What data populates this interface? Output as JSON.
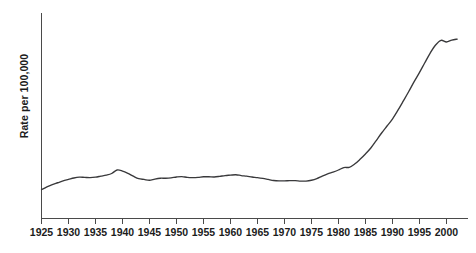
{
  "chart_data": {
    "type": "line",
    "title": "",
    "xlabel": "",
    "ylabel": "Rate per 100,000",
    "xlim": [
      1925,
      2004
    ],
    "ylim": [
      0,
      100
    ],
    "grid": false,
    "legend": null,
    "xticks": [
      1925,
      1930,
      1935,
      1940,
      1945,
      1950,
      1955,
      1960,
      1965,
      1970,
      1975,
      1980,
      1985,
      1990,
      1995,
      2000
    ],
    "xtick_labels": [
      "1925",
      "1930",
      "1935",
      "1940",
      "1945",
      "1950",
      "1955",
      "1960",
      "1965",
      "1970",
      "1975",
      "1980",
      "1985",
      "1990",
      "1995",
      "2000"
    ],
    "yticks": [],
    "ytick_labels": [],
    "series": [
      {
        "name": "Rate per 100,000",
        "color": "#39393b",
        "x": [
          1925,
          1926,
          1927,
          1928,
          1929,
          1930,
          1931,
          1932,
          1933,
          1934,
          1935,
          1936,
          1937,
          1938,
          1939,
          1940,
          1941,
          1942,
          1943,
          1944,
          1945,
          1946,
          1947,
          1948,
          1949,
          1950,
          1951,
          1952,
          1953,
          1954,
          1955,
          1956,
          1957,
          1958,
          1959,
          1960,
          1961,
          1962,
          1963,
          1964,
          1965,
          1966,
          1967,
          1968,
          1969,
          1970,
          1971,
          1972,
          1973,
          1974,
          1975,
          1976,
          1977,
          1978,
          1979,
          1980,
          1981,
          1982,
          1983,
          1984,
          1985,
          1986,
          1987,
          1988,
          1989,
          1990,
          1991,
          1992,
          1993,
          1994,
          1995,
          1996,
          1997,
          1998,
          1999,
          2000,
          2001,
          2002
        ],
        "y": [
          14.0,
          15.4,
          16.5,
          17.4,
          18.3,
          19.0,
          19.7,
          20.1,
          20.0,
          19.9,
          20.1,
          20.6,
          21.1,
          21.9,
          23.6,
          23.1,
          22.0,
          20.6,
          19.4,
          19.0,
          18.6,
          19.2,
          19.6,
          19.6,
          19.8,
          20.2,
          20.4,
          20.0,
          19.9,
          20.0,
          20.3,
          20.3,
          20.2,
          20.5,
          20.9,
          21.1,
          21.3,
          20.9,
          20.6,
          20.2,
          19.9,
          19.5,
          19.0,
          18.5,
          18.3,
          18.3,
          18.4,
          18.4,
          18.2,
          18.2,
          18.6,
          19.4,
          20.6,
          21.7,
          22.6,
          23.6,
          24.8,
          24.9,
          26.5,
          28.8,
          31.4,
          34.3,
          37.9,
          41.6,
          45.0,
          48.4,
          52.6,
          57.1,
          61.7,
          66.5,
          71.0,
          75.8,
          80.5,
          84.4,
          86.7,
          85.9,
          86.8,
          87.3
        ]
      }
    ]
  },
  "axes": {
    "y_axis_title": "Rate per 100,000"
  }
}
